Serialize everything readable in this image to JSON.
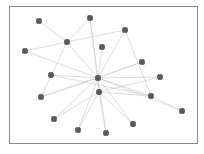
{
  "diagram": {
    "type": "network-graph",
    "frame": {
      "x": 9,
      "y": 6,
      "width": 189,
      "height": 138,
      "border_color": "#8a8a8a"
    },
    "colors": {
      "node": "#5a5a5a",
      "node_stroke": "#3a3a3a",
      "edge": "#cfcfcf",
      "background": "#ffffff"
    },
    "nodes": [
      {
        "id": "n0",
        "x": 39,
        "y": 21
      },
      {
        "id": "n1",
        "x": 90,
        "y": 18
      },
      {
        "id": "n2",
        "x": 125,
        "y": 30
      },
      {
        "id": "n3",
        "x": 67,
        "y": 42
      },
      {
        "id": "n4",
        "x": 25,
        "y": 51
      },
      {
        "id": "n5",
        "x": 102,
        "y": 47
      },
      {
        "id": "n6",
        "x": 142,
        "y": 62
      },
      {
        "id": "n7",
        "x": 51,
        "y": 75
      },
      {
        "id": "n8",
        "x": 98,
        "y": 78
      },
      {
        "id": "n9",
        "x": 160,
        "y": 77
      },
      {
        "id": "n10",
        "x": 41,
        "y": 97
      },
      {
        "id": "n11",
        "x": 99,
        "y": 92
      },
      {
        "id": "n12",
        "x": 151,
        "y": 96
      },
      {
        "id": "n13",
        "x": 182,
        "y": 111
      },
      {
        "id": "n14",
        "x": 54,
        "y": 119
      },
      {
        "id": "n15",
        "x": 78,
        "y": 130
      },
      {
        "id": "n16",
        "x": 106,
        "y": 133
      },
      {
        "id": "n17",
        "x": 133,
        "y": 124
      }
    ],
    "edges": [
      [
        "n0",
        "n3"
      ],
      [
        "n1",
        "n3"
      ],
      [
        "n3",
        "n4"
      ],
      [
        "n3",
        "n2"
      ],
      [
        "n3",
        "n8"
      ],
      [
        "n3",
        "n10"
      ],
      [
        "n1",
        "n8"
      ],
      [
        "n1",
        "n11"
      ],
      [
        "n2",
        "n8"
      ],
      [
        "n2",
        "n12"
      ],
      [
        "n5",
        "n8"
      ],
      [
        "n4",
        "n8"
      ],
      [
        "n6",
        "n8"
      ],
      [
        "n6",
        "n10"
      ],
      [
        "n7",
        "n8"
      ],
      [
        "n7",
        "n12"
      ],
      [
        "n8",
        "n9"
      ],
      [
        "n8",
        "n12"
      ],
      [
        "n8",
        "n11"
      ],
      [
        "n8",
        "n14"
      ],
      [
        "n8",
        "n15"
      ],
      [
        "n8",
        "n16"
      ],
      [
        "n8",
        "n17"
      ],
      [
        "n8",
        "n10"
      ],
      [
        "n11",
        "n9"
      ],
      [
        "n11",
        "n15"
      ],
      [
        "n11",
        "n16"
      ],
      [
        "n11",
        "n17"
      ],
      [
        "n11",
        "n12"
      ],
      [
        "n12",
        "n13"
      ],
      [
        "n11",
        "n14"
      ],
      [
        "n8",
        "n13"
      ]
    ]
  }
}
